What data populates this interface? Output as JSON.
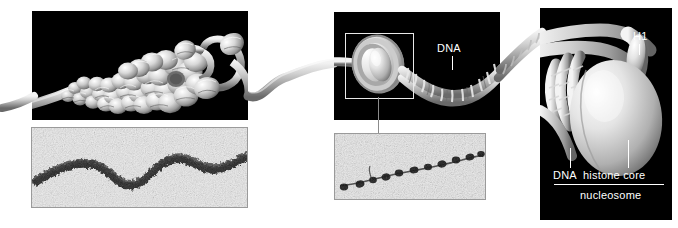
{
  "figure": {
    "background_color": "#ffffff",
    "panel_color": "#000000",
    "label_color": "#ffffff"
  },
  "panels": [
    {
      "id": "left-condensed-fiber",
      "name": "condensed-chromatin-panel",
      "x": 32,
      "y": 11,
      "width": 216,
      "height": 109,
      "description": "30 nm condensed chromatin fiber unwinding into nucleosome string"
    },
    {
      "id": "middle-nucleosome-string",
      "name": "nucleosome-string-panel",
      "x": 334,
      "y": 12,
      "width": 166,
      "height": 108,
      "description": "Nucleosome with linker DNA double helix"
    },
    {
      "id": "right-nucleosome-detail",
      "name": "nucleosome-detail-panel",
      "x": 540,
      "y": 8,
      "width": 132,
      "height": 212,
      "description": "Single nucleosome detail with histone H1"
    }
  ],
  "micrographs": [
    {
      "id": "left-micrograph",
      "name": "thirty-nm-fiber-micrograph",
      "x": 31,
      "y": 127,
      "width": 217,
      "height": 81,
      "description": "Electron micrograph of condensed 30 nm chromatin fiber"
    },
    {
      "id": "middle-micrograph",
      "name": "beads-on-string-micrograph",
      "x": 334,
      "y": 133,
      "width": 152,
      "height": 67,
      "description": "Electron micrograph of beads-on-a-string nucleosomes"
    }
  ],
  "labels": {
    "dna_middle": "DNA",
    "h1": "H1",
    "dna_right": "DNA",
    "histone_core": "histone core",
    "nucleosome": "nucleosome"
  },
  "annotations": {
    "selection_box": {
      "x": 345,
      "y": 33,
      "width": 67,
      "height": 64
    },
    "connector_line": {
      "x": 378,
      "y": 97,
      "height": 36
    }
  }
}
